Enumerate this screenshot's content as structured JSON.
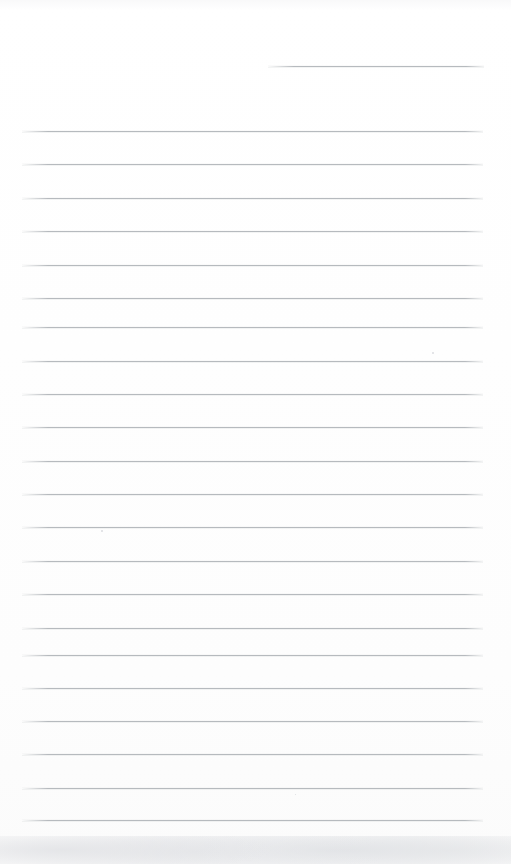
{
  "document": {
    "kind": "scanned-blank-ruled-paper",
    "page_width": 511,
    "page_height": 864,
    "background_color": "#ffffff",
    "rule_color": "#b6babe",
    "rule_thickness": 1,
    "text_content": "",
    "notes": "Blank lined notepad sheet; no handwriting, headings, page numbers or other text is present."
  },
  "rules": {
    "count": 23,
    "left_margin": 22,
    "right_margin": 483,
    "spacing": 33.4,
    "first_full_rule_y": 131,
    "last_rule_y": 820,
    "lines": [
      {
        "id": "rule-1",
        "x": 268,
        "y": 66,
        "width": 216,
        "partial": true
      },
      {
        "id": "rule-2",
        "x": 22,
        "y": 131,
        "width": 461,
        "partial": false
      },
      {
        "id": "rule-3",
        "x": 22,
        "y": 164,
        "width": 461,
        "partial": false
      },
      {
        "id": "rule-4",
        "x": 22,
        "y": 198,
        "width": 461,
        "partial": false
      },
      {
        "id": "rule-5",
        "x": 22,
        "y": 231,
        "width": 461,
        "partial": false
      },
      {
        "id": "rule-6",
        "x": 22,
        "y": 265,
        "width": 461,
        "partial": false
      },
      {
        "id": "rule-7",
        "x": 22,
        "y": 298,
        "width": 461,
        "partial": false
      },
      {
        "id": "rule-8",
        "x": 22,
        "y": 327,
        "width": 461,
        "partial": false
      },
      {
        "id": "rule-9",
        "x": 22,
        "y": 361,
        "width": 461,
        "partial": false
      },
      {
        "id": "rule-10",
        "x": 22,
        "y": 394,
        "width": 461,
        "partial": false
      },
      {
        "id": "rule-11",
        "x": 22,
        "y": 427,
        "width": 461,
        "partial": false
      },
      {
        "id": "rule-12",
        "x": 22,
        "y": 461,
        "width": 461,
        "partial": false
      },
      {
        "id": "rule-13",
        "x": 22,
        "y": 494,
        "width": 461,
        "partial": false
      },
      {
        "id": "rule-14",
        "x": 22,
        "y": 527,
        "width": 461,
        "partial": false
      },
      {
        "id": "rule-15",
        "x": 22,
        "y": 561,
        "width": 461,
        "partial": false
      },
      {
        "id": "rule-16",
        "x": 22,
        "y": 594,
        "width": 461,
        "partial": false
      },
      {
        "id": "rule-17",
        "x": 22,
        "y": 628,
        "width": 461,
        "partial": false
      },
      {
        "id": "rule-18",
        "x": 22,
        "y": 655,
        "width": 461,
        "partial": false
      },
      {
        "id": "rule-19",
        "x": 22,
        "y": 688,
        "width": 461,
        "partial": false
      },
      {
        "id": "rule-20",
        "x": 22,
        "y": 721,
        "width": 461,
        "partial": false
      },
      {
        "id": "rule-21",
        "x": 22,
        "y": 754,
        "width": 461,
        "partial": false
      },
      {
        "id": "rule-22",
        "x": 22,
        "y": 788,
        "width": 461,
        "partial": false
      },
      {
        "id": "rule-23",
        "x": 22,
        "y": 820,
        "width": 461,
        "partial": false
      }
    ]
  },
  "artifacts": {
    "specks": [
      {
        "id": "speck-1",
        "x": 432,
        "y": 352,
        "size": 2
      },
      {
        "id": "speck-2",
        "x": 101,
        "y": 530,
        "size": 2
      },
      {
        "id": "speck-3",
        "x": 295,
        "y": 794,
        "size": 1
      }
    ],
    "smudge": {
      "x": 0,
      "y": 836,
      "width": 511,
      "height": 28
    }
  }
}
